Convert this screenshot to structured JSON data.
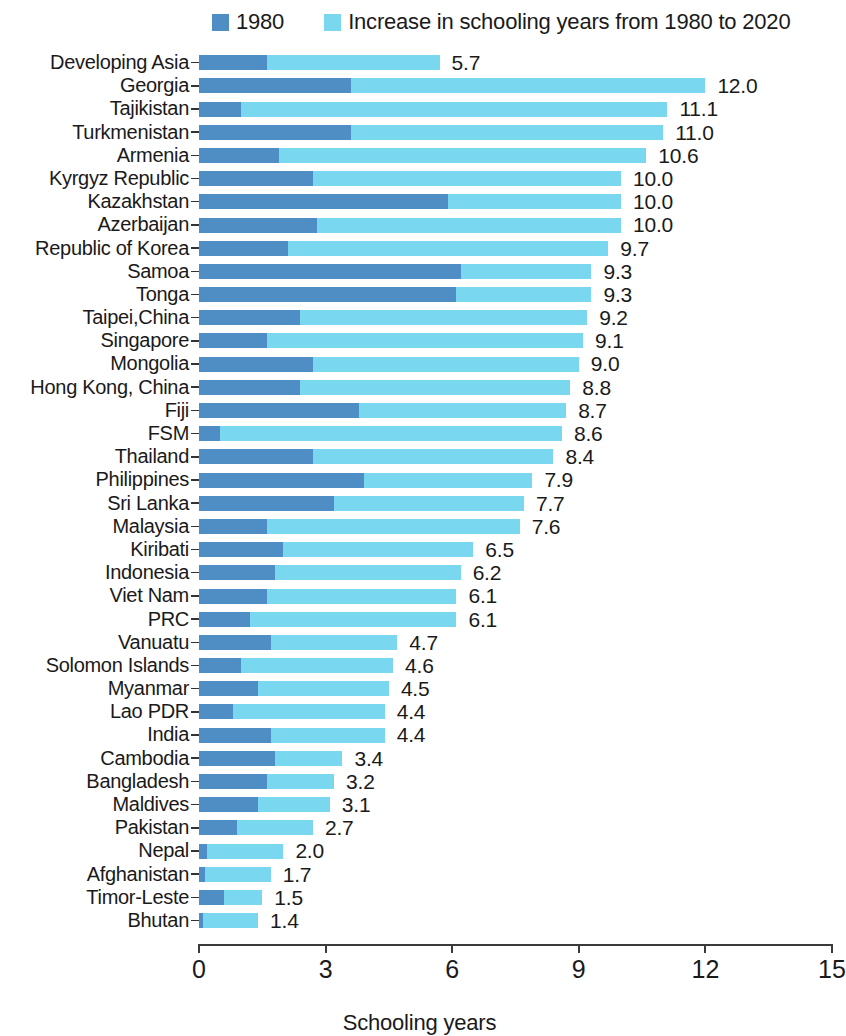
{
  "colors": {
    "series_1980": "#4f8ec4",
    "series_increase": "#7ad7f0",
    "axis": "#3a3a3a",
    "text": "#1a1a1a"
  },
  "legend": {
    "items": [
      {
        "label": "1980",
        "color_key": "series_1980"
      },
      {
        "label": "Increase in schooling years from 1980 to 2020",
        "color_key": "series_increase"
      }
    ]
  },
  "axis": {
    "x_title": "Schooling years",
    "ticks": [
      0,
      3,
      6,
      9,
      12,
      15
    ],
    "tick_labels": [
      "0",
      "3",
      "6",
      "9",
      "12",
      "15"
    ],
    "xlim": [
      0,
      15
    ]
  },
  "chart_data": {
    "type": "bar",
    "orientation": "horizontal",
    "stacked": true,
    "title": "",
    "subtitle": "",
    "xlabel": "Schooling years",
    "ylabel": "",
    "xlim": [
      0,
      15
    ],
    "xticks": [
      0,
      3,
      6,
      9,
      12,
      15
    ],
    "grid": false,
    "legend_position": "top",
    "categories": [
      "Developing Asia",
      "Georgia",
      "Tajikistan",
      "Turkmenistan",
      "Armenia",
      "Kyrgyz Republic",
      "Kazakhstan",
      "Azerbaijan",
      "Republic of Korea",
      "Samoa",
      "Tonga",
      "Taipei,China",
      "Singapore",
      "Mongolia",
      "Hong Kong, China",
      "Fiji",
      "FSM",
      "Thailand",
      "Philippines",
      "Sri Lanka",
      "Malaysia",
      "Kiribati",
      "Indonesia",
      "Viet Nam",
      "PRC",
      "Vanuatu",
      "Solomon Islands",
      "Myanmar",
      "Lao PDR",
      "India",
      "Cambodia",
      "Bangladesh",
      "Maldives",
      "Pakistan",
      "Nepal",
      "Afghanistan",
      "Timor-Leste",
      "Bhutan"
    ],
    "series": [
      {
        "name": "1980",
        "color": "#4f8ec4",
        "values": [
          1.6,
          3.6,
          1.0,
          3.6,
          1.9,
          2.7,
          5.9,
          2.8,
          2.1,
          6.2,
          6.1,
          2.4,
          1.6,
          2.7,
          2.4,
          3.8,
          0.5,
          2.7,
          3.9,
          3.2,
          1.6,
          2.0,
          1.8,
          1.6,
          1.2,
          1.7,
          1.0,
          1.4,
          0.8,
          1.7,
          1.8,
          1.6,
          1.4,
          0.9,
          0.2,
          0.15,
          0.6,
          0.1
        ]
      },
      {
        "name": "Increase in schooling years from 1980 to 2020",
        "color": "#7ad7f0",
        "values": [
          4.1,
          8.4,
          10.1,
          7.4,
          8.7,
          7.3,
          4.1,
          7.2,
          7.6,
          3.1,
          3.2,
          6.8,
          7.5,
          6.3,
          6.4,
          4.9,
          8.1,
          5.7,
          4.0,
          4.5,
          6.0,
          4.5,
          4.4,
          4.5,
          4.9,
          3.0,
          3.6,
          3.1,
          3.6,
          2.7,
          1.6,
          1.6,
          1.7,
          1.8,
          1.8,
          1.55,
          0.9,
          1.3
        ]
      }
    ],
    "totals": [
      5.7,
      12.0,
      11.1,
      11.0,
      10.6,
      10.0,
      10.0,
      10.0,
      9.7,
      9.3,
      9.3,
      9.2,
      9.1,
      9.0,
      8.8,
      8.7,
      8.6,
      8.4,
      7.9,
      7.7,
      7.6,
      6.5,
      6.2,
      6.1,
      6.1,
      4.7,
      4.6,
      4.5,
      4.4,
      4.4,
      3.4,
      3.2,
      3.1,
      2.7,
      2.0,
      1.7,
      1.5,
      1.4
    ],
    "total_labels": [
      "5.7",
      "12.0",
      "11.1",
      "11.0",
      "10.6",
      "10.0",
      "10.0",
      "10.0",
      "9.7",
      "9.3",
      "9.3",
      "9.2",
      "9.1",
      "9.0",
      "8.8",
      "8.7",
      "8.6",
      "8.4",
      "7.9",
      "7.7",
      "7.6",
      "6.5",
      "6.2",
      "6.1",
      "6.1",
      "4.7",
      "4.6",
      "4.5",
      "4.4",
      "4.4",
      "3.4",
      "3.2",
      "3.1",
      "2.7",
      "2.0",
      "1.7",
      "1.5",
      "1.4"
    ]
  }
}
